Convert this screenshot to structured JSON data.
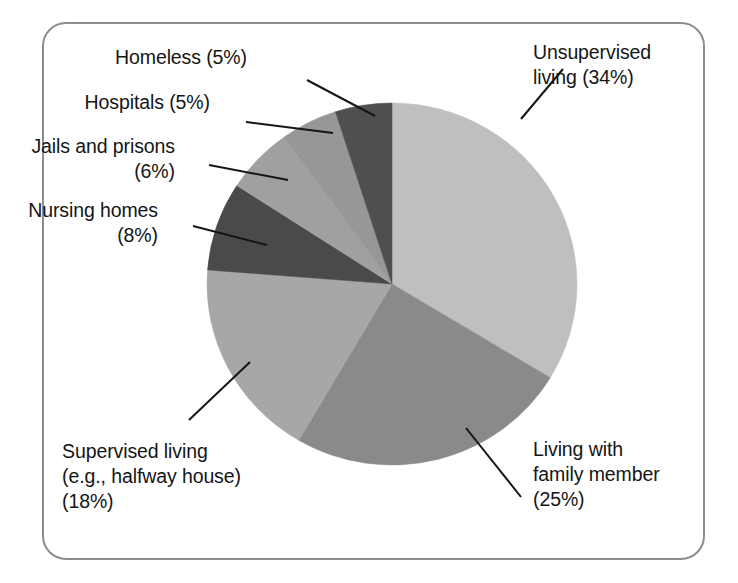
{
  "figure": {
    "frame_color": "#8d8d8d",
    "background": "#ffffff"
  },
  "chart_data": {
    "type": "pie",
    "title": "",
    "subtitle": "",
    "xlabel": "",
    "ylabel": "",
    "legend_position": "callout-labels",
    "grid": false,
    "start_angle_deg": 0,
    "direction": "clockwise",
    "total_percent": 101,
    "categories": [
      "Unsupervised living",
      "Living with family member",
      "Supervised living (e.g., halfway house)",
      "Nursing homes",
      "Jails and prisons",
      "Hospitals",
      "Homeless"
    ],
    "values": [
      34,
      25,
      18,
      8,
      6,
      5,
      5
    ],
    "colors": [
      "#bfbfbf",
      "#8a8a8a",
      "#a7a7a7",
      "#4a4a4a",
      "#a0a0a0",
      "#979797",
      "#4f4f4f"
    ],
    "slices": [
      {
        "name": "Unsupervised living",
        "value": 34,
        "label": "Unsupervised\nliving (34%)",
        "color": "#bfbfbf"
      },
      {
        "name": "Living with family member",
        "value": 25,
        "label": "Living with\nfamily member\n(25%)",
        "color": "#8a8a8a"
      },
      {
        "name": "Supervised living",
        "value": 18,
        "label": "Supervised living\n(e.g., halfway house)\n(18%)",
        "color": "#a7a7a7"
      },
      {
        "name": "Nursing homes",
        "value": 8,
        "label": "Nursing homes\n(8%)",
        "color": "#4a4a4a"
      },
      {
        "name": "Jails and prisons",
        "value": 6,
        "label": "Jails and prisons\n(6%)",
        "color": "#a0a0a0"
      },
      {
        "name": "Hospitals",
        "value": 5,
        "label": "Hospitals (5%)",
        "color": "#979797"
      },
      {
        "name": "Homeless",
        "value": 5,
        "label": "Homeless (5%)",
        "color": "#4f4f4f"
      }
    ]
  },
  "labels": {
    "unsupervised": "Unsupervised\nliving (34%)",
    "living_family": "Living with\nfamily member\n(25%)",
    "supervised": "Supervised living\n(e.g., halfway house)\n(18%)",
    "nursing": "Nursing homes\n(8%)",
    "jails": "Jails and prisons\n(6%)",
    "hospitals": "Hospitals (5%)",
    "homeless": "Homeless (5%)"
  }
}
